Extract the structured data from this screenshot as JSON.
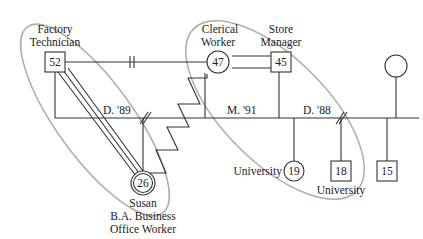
{
  "colors": {
    "line": "#333333",
    "ellipse": "#b0b0b0",
    "text": "#222222"
  },
  "people": {
    "father": {
      "age": "52",
      "occupation_line1": "Factory",
      "occupation_line2": "Technician",
      "shape": "square"
    },
    "mother": {
      "age": "47",
      "occupation_line1": "Clerical",
      "occupation_line2": "Worker",
      "shape": "circle"
    },
    "stepfather": {
      "age": "45",
      "occupation_line1": "Store",
      "occupation_line2": "Manager",
      "shape": "square"
    },
    "susan": {
      "age": "26",
      "name": "Susan",
      "education": "B.A. Business",
      "occupation": "Office Worker",
      "shape": "double-circle"
    },
    "half_sister": {
      "age": "19",
      "note": "University",
      "shape": "circle"
    },
    "stepbrother": {
      "age": "18",
      "note": "University",
      "shape": "square"
    },
    "stepbrother2": {
      "age": "15",
      "shape": "square"
    },
    "ex_wife_of_stepfather": {
      "age": "",
      "shape": "circle"
    }
  },
  "relationships": {
    "divorce_1": "D. '89",
    "marriage": "M. '91",
    "divorce_2": "D. '88"
  }
}
